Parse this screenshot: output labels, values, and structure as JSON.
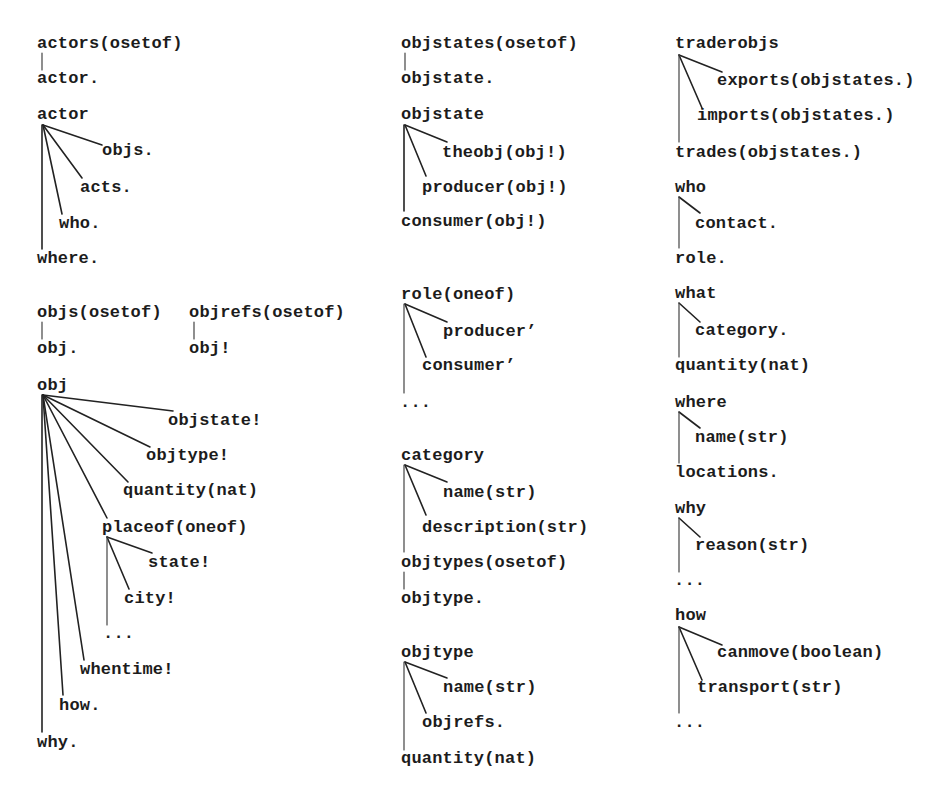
{
  "diagram": {
    "colors": {
      "background": "#ffffff",
      "text": "#1c1c1c",
      "lines": "#222222"
    },
    "trees": {
      "actors": {
        "root": "actors(osetof)",
        "children": [
          "actor."
        ]
      },
      "actor": {
        "root": "actor",
        "children": [
          "objs.",
          "acts.",
          "who.",
          "where."
        ]
      },
      "objs": {
        "root": "objs(osetof)",
        "children": [
          "obj."
        ]
      },
      "objrefs": {
        "root": "objrefs(osetof)",
        "children": [
          "obj!"
        ]
      },
      "obj": {
        "root": "obj",
        "children": [
          "objstate!",
          "objtype!",
          "quantity(nat)",
          "placeof(oneof)",
          "whentime!",
          "how.",
          "why."
        ]
      },
      "placeof": {
        "children": [
          "state!",
          "city!",
          "..."
        ]
      },
      "objstates": {
        "root": "objstates(osetof)",
        "children": [
          "objstate."
        ]
      },
      "objstate": {
        "root": "objstate",
        "children": [
          "theobj(obj!)",
          "producer(obj!)",
          "consumer(obj!)"
        ]
      },
      "role": {
        "root": "role(oneof)",
        "children": [
          "producer’",
          "consumer’",
          "..."
        ]
      },
      "category": {
        "root": "category",
        "children": [
          "name(str)",
          "description(str)",
          "objtypes(osetof)"
        ]
      },
      "objtypes": {
        "children": [
          "objtype."
        ]
      },
      "objtype": {
        "root": "objtype",
        "children": [
          "name(str)",
          "objrefs.",
          "quantity(nat)"
        ]
      },
      "traderobjs": {
        "root": "traderobjs",
        "children": [
          "exports(objstates.)",
          "imports(objstates.)",
          "trades(objstates.)"
        ]
      },
      "who": {
        "root": "who",
        "children": [
          "contact.",
          "role."
        ]
      },
      "what": {
        "root": "what",
        "children": [
          "category.",
          "quantity(nat)"
        ]
      },
      "where": {
        "root": "where",
        "children": [
          "name(str)",
          "locations."
        ]
      },
      "why": {
        "root": "why",
        "children": [
          "reason(str)",
          "..."
        ]
      },
      "how": {
        "root": "how",
        "children": [
          "canmove(boolean)",
          "transport(str)",
          "..."
        ]
      }
    }
  }
}
